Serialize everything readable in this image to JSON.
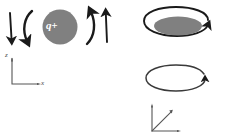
{
  "figure": {
    "background_color": "#ffffff",
    "stroke_color": "#1a1a1a",
    "disc_fill_color": "#808080",
    "disc_label_color": "#ffffff",
    "axis_color": "#4a4a4a"
  },
  "panels": [
    {
      "id": "side-view",
      "name": "side-view-panel",
      "charge": {
        "label": "q+",
        "shape": "circle",
        "fill": "#808080",
        "center_x": 60,
        "center_y": 27,
        "radius": 17
      },
      "arrows": [
        {
          "name": "outer-left-down-arrow",
          "kind": "straight",
          "direction": "down"
        },
        {
          "name": "inner-left-curved-arrow",
          "kind": "curved",
          "direction": "down"
        },
        {
          "name": "inner-right-curved-arrow",
          "kind": "curved",
          "direction": "up"
        },
        {
          "name": "outer-right-up-arrow",
          "kind": "straight",
          "direction": "up"
        }
      ],
      "axes": {
        "name": "axes-2d",
        "type": "2d",
        "vertical_label": "z",
        "horizontal_label": "x",
        "origin_x": 12,
        "origin_y": 84
      }
    },
    {
      "id": "top-view",
      "name": "top-view-panel",
      "charge": {
        "label": "q+",
        "shape": "ellipse",
        "fill": "#808080",
        "center_x": 179,
        "center_y": 26,
        "rx": 23,
        "ry": 9
      },
      "arrows": [
        {
          "name": "upper-loop-arrow",
          "kind": "ellipse-loop",
          "direction": "counterclockwise"
        },
        {
          "name": "lower-loop-arrow",
          "kind": "ellipse-loop",
          "direction": "clockwise"
        }
      ],
      "loops": [
        {
          "name": "charge-orbit-loop",
          "center_x": 178,
          "center_y": 26,
          "rx": 35,
          "ry": 15
        },
        {
          "name": "empty-orbit-loop",
          "center_x": 178,
          "center_y": 80,
          "rx": 31,
          "ry": 12
        }
      ],
      "axes": {
        "name": "axes-3d",
        "type": "3d",
        "vertical_label": "z",
        "diagonal_label": "y",
        "horizontal_label": "x",
        "origin_x": 152,
        "origin_y": 131
      }
    }
  ]
}
